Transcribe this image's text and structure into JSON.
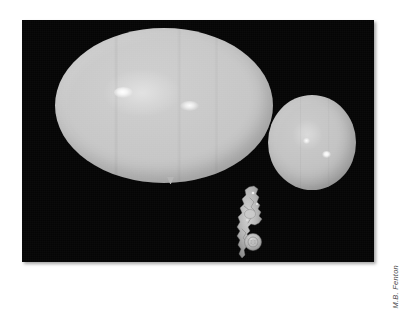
{
  "figure": {
    "caption_credit": "M.B. Fenton",
    "plate_background": "#050505",
    "page_background": "#ffffff"
  },
  "subjects": [
    {
      "id": "balloon-large",
      "name": "large inflated balloon",
      "shape": "ellipse",
      "fill_color": "#c6c6c6",
      "highlight_count": 2
    },
    {
      "id": "balloon-small",
      "name": "small inflated balloon",
      "shape": "circle",
      "fill_color": "#c3c3c3",
      "highlight_count": 2
    },
    {
      "id": "balloon-deflated",
      "name": "uninflated crumpled balloon",
      "shape": "irregular",
      "fill_color": "#b0b0b0",
      "highlight_count": 0
    }
  ],
  "icons": {
    "nozzle": "balloon-nozzle-icon"
  }
}
